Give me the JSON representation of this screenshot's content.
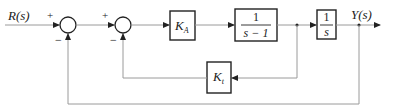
{
  "diagram": {
    "type": "control-system-block-diagram",
    "input": {
      "label": "R(s)"
    },
    "output": {
      "label": "Y(s)"
    },
    "summing_junctions": [
      {
        "id": "sum1",
        "signs": {
          "input": "+",
          "feedback": "−"
        }
      },
      {
        "id": "sum2",
        "signs": {
          "input": "+",
          "feedback": "−"
        }
      }
    ],
    "blocks": {
      "ka": {
        "label_main": "K",
        "label_sub": "A"
      },
      "plant": {
        "numerator": "1",
        "denominator": "s − 1"
      },
      "integrator": {
        "numerator": "1",
        "denominator": "s"
      },
      "kt": {
        "label_main": "K",
        "label_sub": "t"
      }
    },
    "connections": [
      "R(s) → sum1 (+)",
      "sum1 → sum2 (+)",
      "sum2 → K_A",
      "K_A → 1/(s−1)",
      "1/(s−1) → 1/s",
      "1/s → Y(s)",
      "1/(s−1) output → K_t → sum2 (−)",
      "Y(s) → sum1 (−)"
    ]
  }
}
